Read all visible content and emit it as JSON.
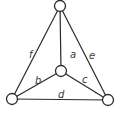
{
  "diagram": {
    "type": "graph",
    "colors": {
      "stroke": "#2a2a2a",
      "label": "#3a3a3a",
      "background": "#ffffff"
    },
    "nodes": [
      {
        "id": "top",
        "x": 60,
        "y": 6
      },
      {
        "id": "center",
        "x": 61,
        "y": 71
      },
      {
        "id": "bottom-left",
        "x": 12,
        "y": 99
      },
      {
        "id": "bottom-right",
        "x": 108,
        "y": 100
      }
    ],
    "edges": [
      {
        "label": "a",
        "from": "top",
        "to": "center",
        "lx": 70,
        "ly": 58
      },
      {
        "label": "b",
        "from": "center",
        "to": "bottom-left",
        "lx": 35,
        "ly": 84
      },
      {
        "label": "c",
        "from": "center",
        "to": "bottom-right",
        "lx": 82,
        "ly": 83
      },
      {
        "label": "d",
        "from": "bottom-left",
        "to": "bottom-right",
        "lx": 58,
        "ly": 98
      },
      {
        "label": "e",
        "from": "top",
        "to": "bottom-right",
        "lx": 89,
        "ly": 59
      },
      {
        "label": "f",
        "from": "top",
        "to": "bottom-left",
        "lx": 29,
        "ly": 58
      }
    ]
  }
}
